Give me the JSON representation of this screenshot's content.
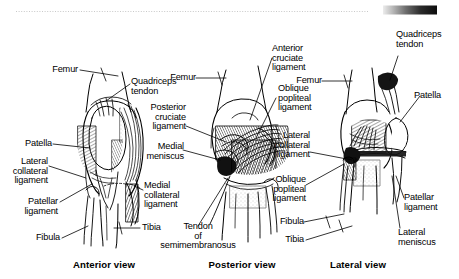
{
  "figure": {
    "background_color": "#ffffff",
    "ink_color": "#000000",
    "decorations": {
      "dotted_rule_color": "#c8c8c8",
      "gradient_bar": {
        "from_color": "#e8e8e8",
        "to_color": "#0d0d0d"
      }
    }
  },
  "panels": [
    {
      "id": "anterior",
      "caption": "Anterior view",
      "labels": [
        "Femur",
        "Quadriceps\ntendon",
        "Patella",
        "Lateral\ncollateral\nligament",
        "Patellar\nligament",
        "Fibula",
        "Medial\ncollateral\nligament",
        "Tibia"
      ]
    },
    {
      "id": "posterior",
      "caption": "Posterior view",
      "labels": [
        "Femur",
        "Posterior\ncruciate\nligament",
        "Medial\nmeniscus",
        "Tendon\nof\nsemimembranosus",
        "Anterior\ncruciate\nligament",
        "Oblique\npopliteal\nligament"
      ]
    },
    {
      "id": "lateral",
      "caption": "Lateral view",
      "labels": [
        "Femur",
        "Lateral\ncollateral\nligament",
        "Oblique\npopliteal\nligament",
        "Fibula",
        "Tibia",
        "Quadriceps\ntendon",
        "Patella",
        "Patellar\nligament",
        "Lateral\nmeniscus"
      ]
    }
  ],
  "callouts": {
    "a_femur": "Femur",
    "a_quadriceps_tendon": "Quadriceps\ntendon",
    "a_patella": "Patella",
    "a_lateral_collateral_ligament": "Lateral\ncollateral\nligament",
    "a_patellar_ligament": "Patellar\nligament",
    "a_fibula": "Fibula",
    "a_medial_collateral_ligament": "Medial\ncollateral\nligament",
    "a_tibia": "Tibia",
    "p_femur": "Femur",
    "p_posterior_cruciate_ligament": "Posterior\ncruciate\nligament",
    "p_medial_meniscus": "Medial\nmeniscus",
    "p_tendon_of_semimembranosus": "Tendon\nof\nsemimembranosus",
    "p_anterior_cruciate_ligament": "Anterior\ncruciate\nligament",
    "p_oblique_popliteal_ligament": "Oblique\npopliteal\nligament",
    "l_femur": "Femur",
    "l_lateral_collateral_ligament": "Lateral\ncollateral\nligament",
    "l_oblique_popliteal_ligament": "Oblique\npopliteal\nligament",
    "l_fibula": "Fibula",
    "l_tibia": "Tibia",
    "l_quadriceps_tendon": "Quadriceps\ntendon",
    "l_patella": "Patella",
    "l_patellar_ligament": "Patellar\nligament",
    "l_lateral_meniscus": "Lateral\nmeniscus"
  },
  "captions": {
    "anterior": "Anterior view",
    "posterior": "Posterior view",
    "lateral": "Lateral view"
  }
}
